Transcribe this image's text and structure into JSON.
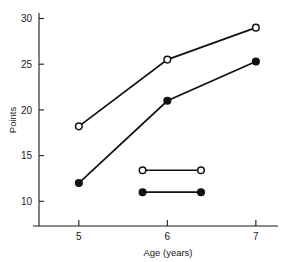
{
  "chart_data": {
    "type": "line",
    "title": "",
    "xlabel": "Age (years)",
    "ylabel": "Points",
    "x": [
      5,
      6,
      7
    ],
    "xlim": [
      4.55,
      7.25
    ],
    "ylim": [
      7.3,
      30.6
    ],
    "xticks": [
      5,
      6,
      7
    ],
    "xtick_labels": [
      "5",
      "6",
      "7"
    ],
    "yticks": [
      10,
      15,
      20,
      25,
      30
    ],
    "ytick_labels": [
      "10",
      "15",
      "20",
      "25",
      "30"
    ],
    "grid": false,
    "legend_position": "inside-center",
    "series": [
      {
        "name": "open-circle-series",
        "marker": "open-circle",
        "values": [
          18.2,
          25.5,
          29.0
        ]
      },
      {
        "name": "filled-circle-series",
        "marker": "filled-circle",
        "values": [
          12.0,
          21.0,
          25.3
        ]
      }
    ],
    "legend_swatches": [
      {
        "name": "open-circle-swatch",
        "marker": "open-circle",
        "x_start": 5.72,
        "x_end": 6.38,
        "y": 13.4,
        "label": ""
      },
      {
        "name": "filled-circle-swatch",
        "marker": "filled-circle",
        "x_start": 5.72,
        "x_end": 6.38,
        "y": 11.0,
        "label": ""
      }
    ]
  },
  "axes": {
    "y_title": "Points",
    "x_title": "Age (years)"
  }
}
